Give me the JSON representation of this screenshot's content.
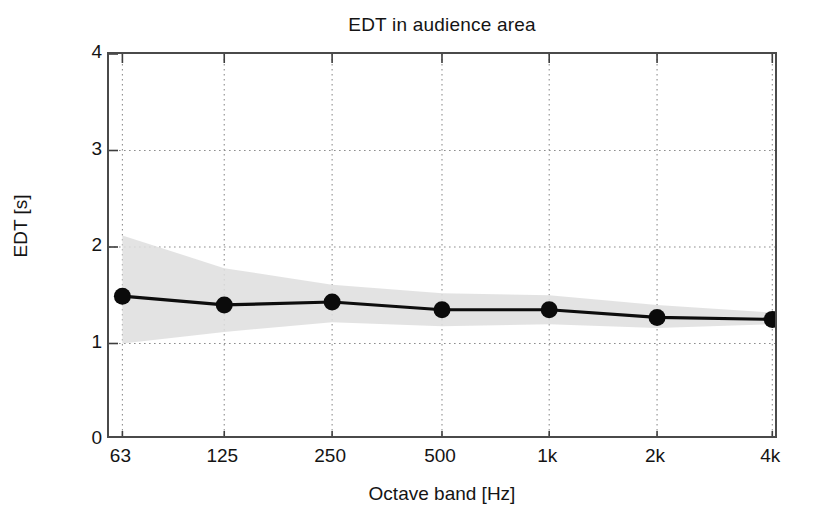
{
  "chart_data": {
    "type": "line",
    "title": "EDT in audience area",
    "xlabel": "Octave band [Hz]",
    "ylabel": "EDT [s]",
    "categories": [
      "63",
      "125",
      "250",
      "500",
      "1k",
      "2k",
      "4k"
    ],
    "x_tick_labels": [
      "63",
      "125",
      "250",
      "500",
      "1k",
      "2k",
      "4k"
    ],
    "y_tick_labels": [
      "0",
      "1",
      "2",
      "3",
      "4"
    ],
    "y_tick_values": [
      0,
      1,
      2,
      3,
      4
    ],
    "ylim": [
      0,
      4
    ],
    "grid": true,
    "legend": "none",
    "series": [
      {
        "name": "EDT mean",
        "style": "line-with-markers",
        "color": "#0b0b0b",
        "values": [
          1.49,
          1.4,
          1.43,
          1.35,
          1.35,
          1.27,
          1.25
        ]
      },
      {
        "name": "EDT spread band",
        "style": "shaded-area",
        "color": "#dedede",
        "upper": [
          2.12,
          1.78,
          1.61,
          1.52,
          1.5,
          1.4,
          1.32
        ],
        "lower": [
          1.0,
          1.12,
          1.22,
          1.18,
          1.2,
          1.16,
          1.2
        ]
      }
    ]
  },
  "axes": {
    "x_ticks_positions_fraction": [
      0.02,
      0.172,
      0.333,
      0.497,
      0.657,
      0.818,
      0.99
    ],
    "frame_color": "#4a4a4a",
    "grid_color": "#8e8e8e",
    "background": "#ffffff"
  }
}
